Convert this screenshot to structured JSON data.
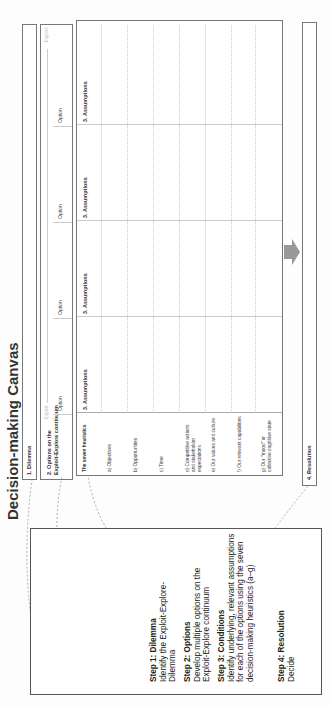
{
  "canvas": {
    "title": "Decision-making Canvas",
    "dilemma_label": "1. Dilemma",
    "options_label_line1": "2. Options on the",
    "options_label_line2": "Exploit-Explore continuum",
    "axis": {
      "left": "Exploit",
      "right": "Explore"
    },
    "options": [
      "Option",
      "Option",
      "Option",
      "Option"
    ],
    "assumptions_label": "3. Assumptions",
    "heuristics_header": "The seven heuristics",
    "heuristics": [
      "a) Objectives",
      "b) Opportunities",
      "c) Time",
      "d) Competitive actions and stakeholder expectations",
      "e) Our values and culture",
      "f) Our relevant capabilities",
      "g) Our \"mood\" or collective cognitive state"
    ],
    "resolution_label": "4. Resolution",
    "arrow_icon": "right-arrow-icon"
  },
  "steps": [
    {
      "title": "Step 1: Dilemma",
      "body": "Identify the Exploit-Explore-Dilemma"
    },
    {
      "title": "Step 2: Options",
      "body": "Develop multiple options on the Exploit-Explore continuum"
    },
    {
      "title": "Step 3: Conditions",
      "body": "Identify underlying, relevant assumptions for each of the options using the seven decision-making heuristics (a–g)"
    },
    {
      "title": "Step 4: Resolution",
      "body": "Decide"
    }
  ],
  "colors": {
    "border": "#777777",
    "arrow": "#999999",
    "connector": "#999999"
  }
}
